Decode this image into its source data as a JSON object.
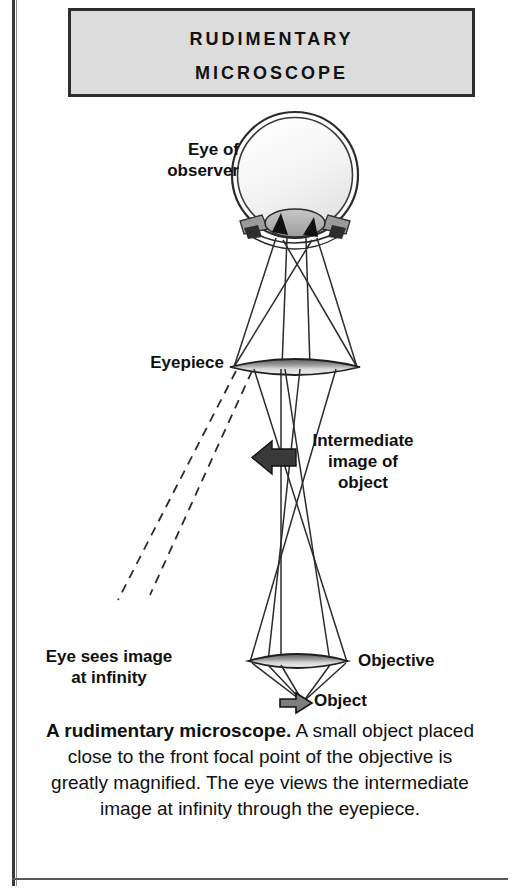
{
  "title": {
    "line1": "Rudimentary",
    "line2": "Microscope"
  },
  "labels": {
    "eye_of_observer": "Eye of\nobserver",
    "eyepiece": "Eyepiece",
    "intermediate_image": "Intermediate\nimage of\nobject",
    "objective": "Objective",
    "object": "Object",
    "eye_sees_infinity": "Eye sees image\nat infinity"
  },
  "caption": {
    "lead": "A rudimentary microscope.",
    "body": "A small object placed close to the front focal point of the objective is greatly magnified. The eye views the intermediate image at infinity through the eyepiece."
  },
  "colors": {
    "title_plate_fill": "#dcdcdc",
    "title_plate_border": "#2e2e2e",
    "ink": "#101010",
    "lens_dark": "#4a4a4a",
    "lens_light": "#e8e8e8",
    "ray": "#2b2b2b",
    "eye_fill": "#f4f4f4"
  },
  "optical_elements": [
    {
      "name": "eye",
      "type": "eyeball",
      "cx": 295,
      "cy": 175,
      "r": 62
    },
    {
      "name": "eyepiece",
      "type": "converging-lens",
      "cx": 295,
      "cy": 367,
      "rx": 63,
      "ry": 9
    },
    {
      "name": "intermediate-image",
      "type": "image-plane",
      "cx": 281,
      "cy": 463
    },
    {
      "name": "objective",
      "type": "converging-lens",
      "cx": 298,
      "cy": 661,
      "rx": 50,
      "ry": 8
    },
    {
      "name": "object",
      "type": "object-arrow",
      "cx": 305,
      "cy": 700
    }
  ]
}
